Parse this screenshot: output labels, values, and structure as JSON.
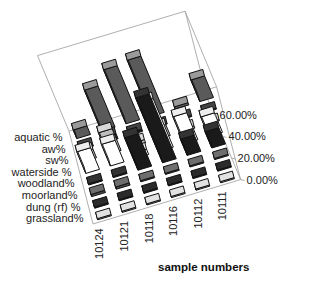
{
  "chart_data": {
    "type": "bar3d",
    "title": "",
    "xlabel": "sample numbers",
    "ylabel": "",
    "zlabel": "",
    "categories": [
      "10124",
      "10121",
      "10118",
      "10116",
      "10112",
      "10111"
    ],
    "series_axis_labels": [
      "aquatic %",
      "aw%",
      "sw%",
      "waterside %",
      "woodland%",
      "moorland%",
      "dung (rf) %",
      "grassland%"
    ],
    "z_ticks": [
      "0.00%",
      "20.00%",
      "40.00%",
      "60.00%"
    ],
    "zlim": [
      0,
      70
    ],
    "series": [
      {
        "name": "aquatic %",
        "fill": "#5a5a5a",
        "top": "#9a9a9a",
        "values": [
          8,
          38,
          50,
          52,
          2,
          20
        ]
      },
      {
        "name": "aw%",
        "fill": "#1e1e1e",
        "top": "#444444",
        "values": [
          2,
          5,
          2,
          1,
          1,
          1
        ]
      },
      {
        "name": "sw%",
        "fill": "#bdbdbd",
        "top": "#d8d8d8",
        "values": [
          8,
          20,
          3,
          10,
          2,
          1
        ]
      },
      {
        "name": "waterside %",
        "fill": "#ffffff",
        "top": "#eeeeee",
        "values": [
          20,
          20,
          5,
          45,
          25,
          18
        ]
      },
      {
        "name": "woodland%",
        "fill": "#1a1a1a",
        "top": "#333333",
        "values": [
          1,
          1,
          30,
          60,
          15,
          15
        ]
      },
      {
        "name": "moorland%",
        "fill": "#4a4a4a",
        "top": "#6e6e6e",
        "values": [
          2,
          2,
          1,
          1,
          1,
          1
        ]
      },
      {
        "name": "dung (rf) %",
        "fill": "#151515",
        "top": "#2b2b2b",
        "values": [
          1,
          1,
          1,
          1,
          1,
          1
        ]
      },
      {
        "name": "grassland%",
        "fill": "#cfcfcf",
        "top": "#e2e2e2",
        "values": [
          1,
          1,
          1,
          1,
          1,
          1
        ]
      }
    ],
    "grid": false,
    "legend_position": "none"
  }
}
